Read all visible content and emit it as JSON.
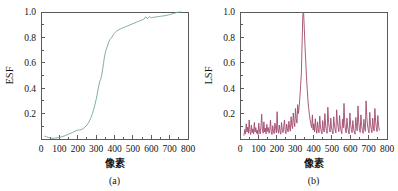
{
  "figure": {
    "background": "#ffffff",
    "panel_count": 2
  },
  "chart_data": [
    {
      "type": "line",
      "panel_label": "(a)",
      "title": "",
      "xlabel": "像素",
      "ylabel": "ESF",
      "xlim": [
        0,
        800
      ],
      "ylim": [
        0,
        1.0
      ],
      "xticks": [
        0,
        100,
        200,
        300,
        400,
        500,
        600,
        700,
        800
      ],
      "xticklabels": [
        "0",
        "100",
        "200",
        "300",
        "400",
        "500",
        "600",
        "700",
        "800"
      ],
      "yticks": [
        0.2,
        0.4,
        0.6,
        0.8,
        1.0
      ],
      "yticklabels": [
        "0.2",
        "0.4",
        "0.6",
        "0.8",
        "1.0"
      ],
      "grid": false,
      "legend": false,
      "line_color": "#74a58f",
      "axis_color": "#5a5a5a",
      "series": [
        {
          "name": "ESF",
          "x": [
            20,
            30,
            40,
            50,
            60,
            70,
            80,
            90,
            100,
            110,
            120,
            130,
            140,
            150,
            160,
            170,
            180,
            190,
            200,
            205,
            210,
            220,
            230,
            240,
            250,
            260,
            270,
            280,
            290,
            300,
            305,
            310,
            315,
            320,
            325,
            330,
            335,
            340,
            345,
            350,
            355,
            360,
            365,
            370,
            375,
            380,
            385,
            390,
            395,
            400,
            410,
            420,
            430,
            440,
            450,
            460,
            470,
            480,
            490,
            500,
            510,
            520,
            530,
            540,
            550,
            560,
            565,
            570,
            575,
            580,
            585,
            590,
            595,
            600,
            605,
            610,
            620,
            630,
            640,
            650,
            660,
            670,
            680,
            690,
            700,
            710,
            720,
            730,
            740,
            750,
            760
          ],
          "y": [
            0.022,
            0.018,
            0.012,
            0.008,
            0.006,
            0.006,
            0.008,
            0.01,
            0.012,
            0.016,
            0.02,
            0.026,
            0.032,
            0.038,
            0.044,
            0.05,
            0.058,
            0.064,
            0.07,
            0.072,
            0.07,
            0.074,
            0.082,
            0.094,
            0.11,
            0.132,
            0.162,
            0.2,
            0.25,
            0.31,
            0.345,
            0.385,
            0.42,
            0.455,
            0.47,
            0.5,
            0.545,
            0.595,
            0.64,
            0.68,
            0.705,
            0.725,
            0.748,
            0.768,
            0.782,
            0.79,
            0.8,
            0.812,
            0.824,
            0.834,
            0.848,
            0.858,
            0.866,
            0.872,
            0.878,
            0.884,
            0.89,
            0.896,
            0.902,
            0.908,
            0.914,
            0.92,
            0.926,
            0.932,
            0.938,
            0.944,
            0.952,
            0.962,
            0.952,
            0.948,
            0.958,
            0.964,
            0.958,
            0.955,
            0.956,
            0.958,
            0.96,
            0.962,
            0.964,
            0.966,
            0.968,
            0.97,
            0.973,
            0.976,
            0.98,
            0.984,
            0.988,
            0.992,
            0.996,
            0.999,
            1.0
          ]
        }
      ]
    },
    {
      "type": "line",
      "panel_label": "(b)",
      "title": "",
      "xlabel": "像素",
      "ylabel": "LSF",
      "xlim": [
        0,
        800
      ],
      "ylim": [
        0,
        1.0
      ],
      "xticks": [
        0,
        100,
        200,
        300,
        400,
        500,
        600,
        700,
        800
      ],
      "xticklabels": [
        "0",
        "100",
        "200",
        "300",
        "400",
        "500",
        "600",
        "700",
        "800"
      ],
      "yticks": [
        0.2,
        0.4,
        0.6,
        0.8,
        1.0
      ],
      "yticklabels": [
        "0.2",
        "0.4",
        "0.6",
        "0.8",
        "1.0"
      ],
      "grid": false,
      "legend": false,
      "line_color": "#a04a6e",
      "axis_color": "#5a5a5a",
      "series": [
        {
          "name": "LSF",
          "x": [
            22,
            26,
            30,
            34,
            38,
            42,
            46,
            50,
            54,
            58,
            62,
            66,
            70,
            74,
            78,
            82,
            86,
            90,
            94,
            98,
            102,
            106,
            110,
            114,
            118,
            122,
            126,
            130,
            134,
            138,
            142,
            146,
            150,
            154,
            158,
            162,
            166,
            170,
            174,
            178,
            182,
            186,
            190,
            194,
            198,
            202,
            206,
            210,
            214,
            218,
            222,
            226,
            230,
            234,
            238,
            242,
            246,
            250,
            254,
            258,
            262,
            266,
            270,
            274,
            278,
            282,
            286,
            290,
            294,
            298,
            302,
            306,
            310,
            314,
            318,
            322,
            326,
            330,
            334,
            338,
            342,
            346,
            350,
            354,
            358,
            362,
            366,
            370,
            374,
            378,
            382,
            386,
            390,
            394,
            398,
            402,
            406,
            410,
            414,
            418,
            422,
            426,
            430,
            434,
            438,
            442,
            446,
            450,
            454,
            458,
            462,
            466,
            470,
            474,
            478,
            482,
            486,
            490,
            494,
            498,
            502,
            506,
            510,
            514,
            518,
            522,
            526,
            530,
            534,
            538,
            542,
            546,
            550,
            554,
            558,
            562,
            566,
            570,
            574,
            578,
            582,
            586,
            590,
            594,
            598,
            602,
            606,
            610,
            614,
            618,
            622,
            626,
            630,
            634,
            638,
            642,
            646,
            650,
            654,
            658,
            662,
            666,
            670,
            674,
            678,
            682,
            686,
            690,
            694,
            698,
            702,
            706,
            710,
            714,
            718,
            722,
            726,
            730,
            734,
            738,
            742,
            746,
            750,
            754,
            758
          ],
          "y": [
            0.03,
            0.075,
            0.04,
            0.12,
            0.055,
            0.095,
            0.045,
            0.15,
            0.06,
            0.035,
            0.11,
            0.05,
            0.08,
            0.04,
            0.13,
            0.055,
            0.09,
            0.045,
            0.07,
            0.035,
            0.125,
            0.06,
            0.04,
            0.1,
            0.195,
            0.07,
            0.045,
            0.135,
            0.055,
            0.085,
            0.04,
            0.115,
            0.06,
            0.09,
            0.045,
            0.07,
            0.15,
            0.055,
            0.035,
            0.105,
            0.062,
            0.042,
            0.125,
            0.085,
            0.048,
            0.215,
            0.07,
            0.045,
            0.11,
            0.06,
            0.038,
            0.13,
            0.072,
            0.05,
            0.095,
            0.15,
            0.065,
            0.042,
            0.118,
            0.08,
            0.055,
            0.14,
            0.09,
            0.062,
            0.175,
            0.11,
            0.082,
            0.205,
            0.135,
            0.098,
            0.24,
            0.16,
            0.125,
            0.27,
            0.2,
            0.255,
            0.33,
            0.42,
            0.52,
            0.76,
            0.98,
            1.0,
            0.87,
            0.72,
            0.61,
            0.48,
            0.39,
            0.3,
            0.24,
            0.185,
            0.15,
            0.115,
            0.09,
            0.19,
            0.07,
            0.12,
            0.055,
            0.16,
            0.085,
            0.045,
            0.135,
            0.075,
            0.05,
            0.18,
            0.095,
            0.06,
            0.04,
            0.145,
            0.08,
            0.055,
            0.2,
            0.105,
            0.068,
            0.045,
            0.25,
            0.13,
            0.085,
            0.055,
            0.165,
            0.095,
            0.06,
            0.04,
            0.175,
            0.11,
            0.072,
            0.048,
            0.23,
            0.14,
            0.09,
            0.058,
            0.185,
            0.1,
            0.065,
            0.042,
            0.155,
            0.088,
            0.28,
            0.125,
            0.07,
            0.048,
            0.165,
            0.095,
            0.062,
            0.04,
            0.205,
            0.115,
            0.075,
            0.05,
            0.145,
            0.085,
            0.055,
            0.038,
            0.17,
            0.1,
            0.065,
            0.26,
            0.13,
            0.08,
            0.052,
            0.19,
            0.105,
            0.068,
            0.045,
            0.155,
            0.09,
            0.06,
            0.3,
            0.175,
            0.11,
            0.072,
            0.048,
            0.21,
            0.12,
            0.078,
            0.05,
            0.165,
            0.095,
            0.062,
            0.24,
            0.14,
            0.088,
            0.058,
            0.185,
            0.108,
            0.07,
            0.046,
            0.15,
            0.085
          ]
        }
      ]
    }
  ]
}
